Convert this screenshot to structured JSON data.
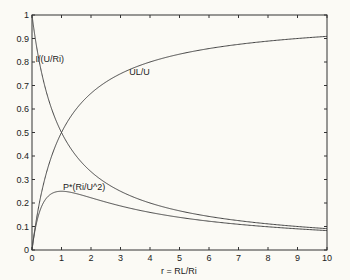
{
  "chart_data": {
    "type": "line",
    "title": "",
    "xlabel": "r = RL/Ri",
    "ylabel": "",
    "xlim": [
      0,
      10
    ],
    "ylim": [
      0,
      1
    ],
    "grid": false,
    "legend": "none",
    "xticks": [
      "0",
      "1",
      "2",
      "3",
      "4",
      "5",
      "6",
      "7",
      "8",
      "9",
      "10"
    ],
    "yticks": [
      "0",
      "0.1",
      "0.2",
      "0.3",
      "0.4",
      "0.5",
      "0.6",
      "0.7",
      "0.8",
      "0.9",
      "1"
    ],
    "xtick_values": [
      0,
      1,
      2,
      3,
      4,
      5,
      6,
      7,
      8,
      9,
      10
    ],
    "ytick_values": [
      0,
      0.1,
      0.2,
      0.3,
      0.4,
      0.5,
      0.6,
      0.7,
      0.8,
      0.9,
      1
    ],
    "series": [
      {
        "name": "I/(U/Ri)",
        "formula": "1/(1+r)",
        "x": [
          0,
          0.25,
          0.5,
          0.75,
          1,
          1.5,
          2,
          3,
          4,
          5,
          6,
          7,
          8,
          9,
          10
        ],
        "values": [
          1,
          0.8,
          0.667,
          0.571,
          0.5,
          0.4,
          0.333,
          0.25,
          0.2,
          0.167,
          0.143,
          0.125,
          0.111,
          0.1,
          0.091
        ],
        "label": "I/(U/Ri)",
        "label_at": [
          0.12,
          0.8
        ]
      },
      {
        "name": "UL/U",
        "formula": "r/(1+r)",
        "x": [
          0,
          0.25,
          0.5,
          0.75,
          1,
          1.5,
          2,
          3,
          4,
          5,
          6,
          7,
          8,
          9,
          10
        ],
        "values": [
          0,
          0.2,
          0.333,
          0.429,
          0.5,
          0.6,
          0.667,
          0.75,
          0.8,
          0.833,
          0.857,
          0.875,
          0.889,
          0.9,
          0.909
        ],
        "label": "UL/U",
        "label_at": [
          3.3,
          0.745
        ]
      },
      {
        "name": "P*(Ri/U^2)",
        "formula": "r/(1+r)^2",
        "x": [
          0,
          0.25,
          0.5,
          0.75,
          1,
          1.5,
          2,
          3,
          4,
          5,
          6,
          7,
          8,
          9,
          10
        ],
        "values": [
          0,
          0.16,
          0.222,
          0.245,
          0.25,
          0.24,
          0.222,
          0.188,
          0.16,
          0.139,
          0.122,
          0.109,
          0.099,
          0.09,
          0.083
        ],
        "label": "P*(Ri/U^2)",
        "label_at": [
          1.05,
          0.255
        ]
      }
    ]
  }
}
